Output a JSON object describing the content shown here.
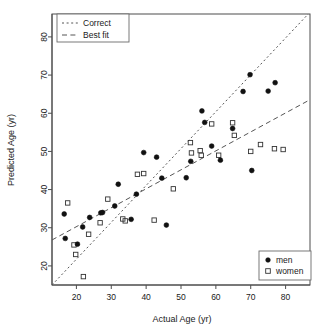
{
  "chart_data": {
    "type": "scatter",
    "title": "",
    "xlabel": "Actual Age (yr)",
    "ylabel": "Predicted Age (yr)",
    "xlim": [
      13,
      87
    ],
    "ylim": [
      15,
      86
    ],
    "xticks": [
      20,
      30,
      40,
      50,
      60,
      70,
      80
    ],
    "yticks": [
      20,
      30,
      40,
      50,
      60,
      70,
      80
    ],
    "grid": false,
    "legend_position": [
      "top-left",
      "bottom-right"
    ],
    "series": [
      {
        "name": "men",
        "marker": "filled-circle",
        "color": "#111111",
        "points": [
          [
            16.5,
            33.6
          ],
          [
            16.8,
            27.2
          ],
          [
            20.3,
            25.7
          ],
          [
            21.8,
            30.2
          ],
          [
            23.8,
            32.7
          ],
          [
            27.0,
            33.9
          ],
          [
            27.5,
            34.0
          ],
          [
            31.0,
            35.7
          ],
          [
            32.0,
            41.4
          ],
          [
            35.7,
            32.2
          ],
          [
            37.2,
            38.8
          ],
          [
            39.3,
            49.7
          ],
          [
            43.0,
            48.5
          ],
          [
            44.5,
            43.0
          ],
          [
            45.8,
            30.7
          ],
          [
            51.5,
            43.1
          ],
          [
            52.8,
            47.4
          ],
          [
            56.0,
            60.6
          ],
          [
            56.8,
            57.6
          ],
          [
            58.8,
            51.4
          ],
          [
            61.3,
            47.7
          ],
          [
            64.8,
            56.0
          ],
          [
            67.8,
            65.7
          ],
          [
            69.8,
            70.1
          ],
          [
            70.3,
            45.0
          ],
          [
            75.0,
            65.8
          ],
          [
            77.0,
            68.0
          ]
        ]
      },
      {
        "name": "women",
        "marker": "open-square",
        "color": "#333333",
        "points": [
          [
            17.5,
            36.5
          ],
          [
            19.3,
            25.5
          ],
          [
            19.8,
            23.0
          ],
          [
            22.0,
            17.2
          ],
          [
            23.5,
            28.3
          ],
          [
            26.8,
            31.3
          ],
          [
            29.0,
            37.5
          ],
          [
            33.3,
            32.3
          ],
          [
            34.0,
            31.8
          ],
          [
            37.5,
            44.0
          ],
          [
            39.3,
            44.2
          ],
          [
            42.3,
            32.0
          ],
          [
            47.8,
            40.2
          ],
          [
            52.7,
            52.3
          ],
          [
            53.0,
            49.6
          ],
          [
            55.5,
            50.2
          ],
          [
            55.8,
            49.0
          ],
          [
            58.8,
            57.2
          ],
          [
            60.8,
            49.0
          ],
          [
            64.8,
            57.5
          ],
          [
            65.3,
            54.2
          ],
          [
            70.0,
            50.0
          ],
          [
            72.8,
            51.8
          ],
          [
            76.8,
            50.7
          ],
          [
            79.3,
            50.5
          ]
        ]
      }
    ],
    "reference_lines": [
      {
        "name": "Correct",
        "style": "dotted",
        "from": [
          13,
          15
        ],
        "to": [
          86.5,
          86
        ],
        "description": "identity line y = x"
      },
      {
        "name": "Best fit",
        "style": "dashed",
        "from": [
          13,
          26.8
        ],
        "to": [
          86.5,
          63.3
        ],
        "description": "regression line"
      }
    ]
  },
  "legend_lines": {
    "title": "",
    "items": [
      {
        "label": "Correct",
        "style": "dotted"
      },
      {
        "label": "Best fit",
        "style": "dashed"
      }
    ]
  },
  "legend_groups": {
    "title": "",
    "items": [
      {
        "label": "men",
        "marker": "filled-circle"
      },
      {
        "label": "women",
        "marker": "open-square"
      }
    ]
  },
  "axes": {
    "x": {
      "title": "Actual Age (yr)",
      "ticks": [
        "20",
        "30",
        "40",
        "50",
        "60",
        "70",
        "80"
      ]
    },
    "y": {
      "title": "Predicted Age (yr)",
      "ticks": [
        "20",
        "30",
        "40",
        "50",
        "60",
        "70",
        "80"
      ]
    }
  },
  "colors": {
    "marker_men": "#111111",
    "marker_women": "#333333",
    "axis": "#4d4d4d",
    "line": "#555555",
    "background": "#ffffff"
  }
}
